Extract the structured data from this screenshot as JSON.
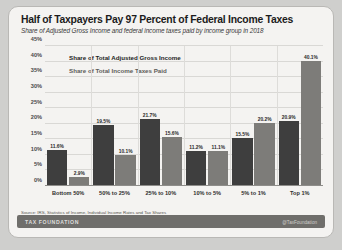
{
  "chart_data": {
    "type": "bar",
    "title": "Half of Taxpayers Pay 97 Percent of Federal Income Taxes",
    "subtitle": "Share of Adjusted Gross Income and federal income taxes paid by income group in 2018",
    "categories": [
      "Bottom 50%",
      "50% to 25%",
      "25% to 10%",
      "10% to 5%",
      "5% to 1%",
      "Top 1%"
    ],
    "series": [
      {
        "name": "Share of Total Adjusted Gross Income",
        "color": "#3e3e3e",
        "values": [
          11.6,
          19.5,
          21.7,
          11.2,
          15.5,
          20.9
        ],
        "labels": [
          "11.6%",
          "19.5%",
          "21.7%",
          "11.2%",
          "15.5%",
          "20.9%"
        ]
      },
      {
        "name": "Share of Total Income Taxes Paid",
        "color": "#7d7c79",
        "values": [
          2.9,
          10.1,
          15.6,
          11.1,
          20.2,
          40.1
        ],
        "labels": [
          "2.9%",
          "10.1%",
          "15.6%",
          "11.1%",
          "20.2%",
          "40.1%"
        ]
      }
    ],
    "ylabel": "",
    "xlabel": "",
    "ylim": [
      0,
      45
    ],
    "yticks": [
      "0%",
      "5%",
      "10%",
      "15%",
      "20%",
      "25%",
      "30%",
      "35%",
      "40%",
      "45%"
    ],
    "ytick_values": [
      0,
      5,
      10,
      15,
      20,
      25,
      30,
      35,
      40,
      45
    ],
    "grid": true,
    "legend_position": "top-left"
  },
  "source": "Source: IRS, Statistics of Income, Individual Income Rates and Tax Shares",
  "footer": {
    "brand": "TAX FOUNDATION",
    "handle": "@TaxFoundation"
  }
}
